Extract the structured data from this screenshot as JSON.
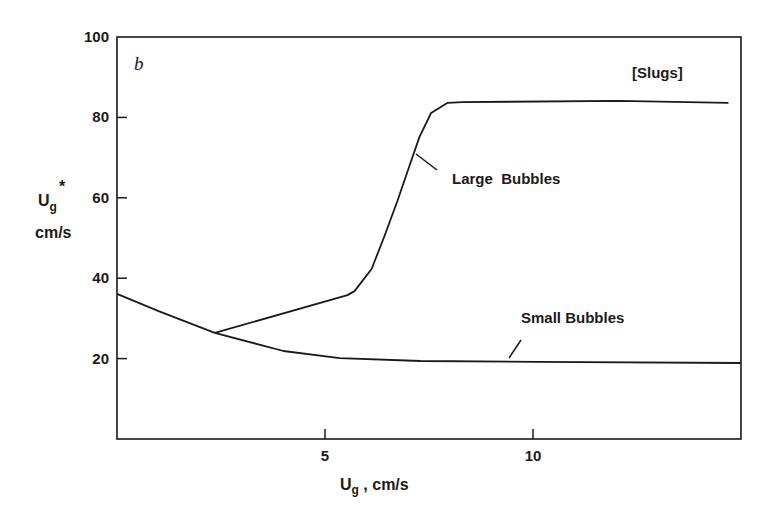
{
  "chart_data": {
    "type": "line",
    "title": "",
    "panel_label": "b",
    "xlabel": "Ug , cm/s",
    "xlabel_parts": {
      "main": "U",
      "sub": "g",
      "rest": " , cm/s"
    },
    "ylabel": "Ug* cm/s",
    "ylabel_parts": {
      "main": "U",
      "sub": "g",
      "sup": "*",
      "unit": "cm/s"
    },
    "xlim": [
      0,
      15
    ],
    "ylim": [
      0,
      100
    ],
    "xticks": [
      5,
      10
    ],
    "xtick_labels": [
      "5",
      "10"
    ],
    "yticks": [
      20,
      40,
      60,
      80,
      100
    ],
    "ytick_labels": [
      "20",
      "40",
      "60",
      "80",
      "100"
    ],
    "grid": false,
    "legend": "none (inline annotations)",
    "series": [
      {
        "name": "Small Bubbles",
        "x": [
          0,
          1.0,
          2.35,
          4.0,
          5.35,
          7.3,
          10.1,
          15.0
        ],
        "y": [
          36.1,
          31.8,
          26.4,
          21.9,
          20.1,
          19.4,
          19.2,
          18.9
        ]
      },
      {
        "name": "Large Bubbles",
        "x": [
          2.35,
          5.54,
          5.71,
          6.12,
          6.43,
          6.74,
          7.03,
          7.27,
          7.55,
          7.94,
          8.3,
          12.06,
          14.7
        ],
        "y": [
          26.4,
          35.8,
          36.8,
          42.3,
          50.5,
          59.2,
          67.9,
          75.1,
          81.1,
          83.6,
          83.8,
          84.1,
          83.6
        ]
      }
    ],
    "annotations": [
      {
        "text": "[Slugs]",
        "x": 12.9,
        "y": 87.5
      },
      {
        "text": "Large  Bubbles",
        "x": 8.05,
        "y": 64.7
      },
      {
        "text": "Small Bubbles",
        "x": 9.7,
        "y": 27.5
      }
    ]
  },
  "colors": {
    "ink": "#1a1a1a",
    "background": "#ffffff"
  }
}
